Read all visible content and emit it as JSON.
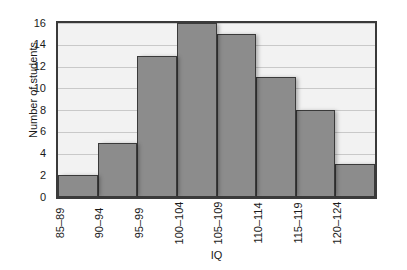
{
  "chart_data": {
    "type": "bar",
    "title": "",
    "subtitle": "",
    "xlabel": "IQ",
    "ylabel": "Number of students",
    "categories": [
      "85–89",
      "90–94",
      "95–99",
      "100–104",
      "105–109",
      "110–114",
      "115–119",
      "120–124"
    ],
    "values": [
      2,
      5,
      13,
      16,
      15,
      11,
      8,
      3
    ],
    "series": [
      {
        "name": "Number of students",
        "values": [
          2,
          5,
          13,
          16,
          15,
          11,
          8,
          3
        ]
      }
    ],
    "ylim": [
      0,
      16
    ],
    "xlim_note": "categorical bins, contiguous histogram bars",
    "y_ticks": [
      "0",
      "2",
      "4",
      "6",
      "8",
      "10",
      "12",
      "14",
      "16"
    ],
    "y_tick_values": [
      0,
      2,
      4,
      6,
      8,
      10,
      12,
      14,
      16
    ],
    "grid": "horizontal",
    "legend": "none",
    "annotations": [],
    "bar_style": "contiguous histogram bars with dark outline and drop shadow",
    "colors": {
      "bar_fill": "#8c8c8c",
      "bar_edge": "#3a3a3a",
      "plot_background": "#f2f2f2",
      "gridline": "#c9c9c9",
      "frame": "#3a3a3a",
      "text": "#1a1a1a",
      "figure_background": "#ffffff"
    }
  }
}
